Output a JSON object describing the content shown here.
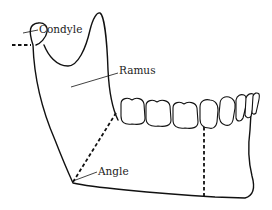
{
  "diagram": {
    "labels": [
      {
        "id": "condyle",
        "text": "Condyle"
      },
      {
        "id": "ramus",
        "text": "Ramus"
      },
      {
        "id": "angle",
        "text": "Angle"
      }
    ],
    "colors": {
      "line": "#111111",
      "background": "#ffffff",
      "text": "#222222"
    }
  }
}
